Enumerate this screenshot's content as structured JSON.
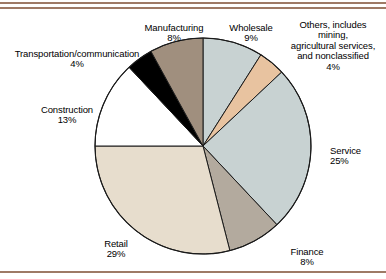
{
  "figure": {
    "background_color": "#ffffff",
    "rule_color": "#9e7a66",
    "outline_color": "#1a1a1a"
  },
  "chart_data": {
    "type": "pie",
    "title": "",
    "subtitle": "",
    "xlabel": "",
    "ylabel": "",
    "legend_position": "callout-labels",
    "grid": false,
    "start_angle_deg": 0,
    "direction": "clockwise",
    "total_percent": 100,
    "categories": [
      "Wholesale",
      "Others, includes mining, agricultural services, and nonclassified",
      "Service",
      "Finance",
      "Retail",
      "Construction",
      "Transportation/communication",
      "Manufacturing"
    ],
    "values": [
      9,
      4,
      25,
      8,
      29,
      13,
      4,
      8
    ],
    "slices": [
      {
        "name": "Wholesale",
        "label": "Wholesale",
        "percent": 9,
        "percent_text": "9%",
        "color": "#c8d2d2",
        "start_deg": 0,
        "end_deg": 32.4
      },
      {
        "name": "Others",
        "label": "Others, includes\nmining,\nagricultural services,\nand nonclassified",
        "percent": 4,
        "percent_text": "4%",
        "color": "#e8c3a0",
        "start_deg": 32.4,
        "end_deg": 46.8
      },
      {
        "name": "Service",
        "label": "Service",
        "percent": 25,
        "percent_text": "25%",
        "color": "#c8d2d2",
        "start_deg": 46.8,
        "end_deg": 136.8
      },
      {
        "name": "Finance",
        "label": "Finance",
        "percent": 8,
        "percent_text": "8%",
        "color": "#b3aa9e",
        "start_deg": 136.8,
        "end_deg": 165.6
      },
      {
        "name": "Retail",
        "label": "Retail",
        "percent": 29,
        "percent_text": "29%",
        "color": "#e7ddcd",
        "start_deg": 165.6,
        "end_deg": 270.0
      },
      {
        "name": "Construction",
        "label": "Construction",
        "percent": 13,
        "percent_text": "13%",
        "color": "#ffffff",
        "start_deg": 270.0,
        "end_deg": 316.8
      },
      {
        "name": "Transportation/communication",
        "label": "Transportation/communication",
        "percent": 4,
        "percent_text": "4%",
        "color": "#000000",
        "start_deg": 316.8,
        "end_deg": 331.2
      },
      {
        "name": "Manufacturing",
        "label": "Manufacturing",
        "percent": 8,
        "percent_text": "8%",
        "color": "#a08f7e",
        "start_deg": 331.2,
        "end_deg": 360.0
      }
    ]
  },
  "labels": {
    "manufacturing": {
      "name": "Manufacturing",
      "percent": "8%"
    },
    "wholesale": {
      "name": "Wholesale",
      "percent": "9%"
    },
    "others": {
      "name": "Others, includes\nmining,\nagricultural services,\nand nonclassified",
      "percent": "4%"
    },
    "transportation": {
      "name": "Transportation/communication",
      "percent": "4%"
    },
    "construction": {
      "name": "Construction",
      "percent": "13%"
    },
    "service": {
      "name": "Service",
      "percent": "25%"
    },
    "finance": {
      "name": "Finance",
      "percent": "8%"
    },
    "retail": {
      "name": "Retail",
      "percent": "29%"
    }
  }
}
